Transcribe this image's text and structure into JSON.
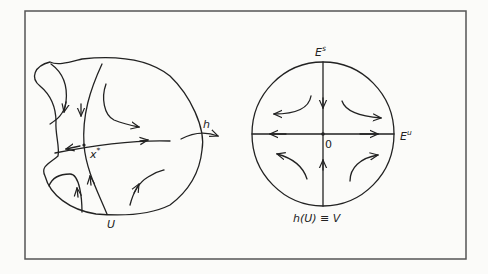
{
  "figure": {
    "frame": {
      "stroke": "#555555",
      "background": "#fbfbf9"
    },
    "left_panel": {
      "region_label": "U",
      "fixed_point_label": "x",
      "fixed_point_sup": "*"
    },
    "map": {
      "label": "h"
    },
    "right_panel": {
      "stable_label": "E",
      "stable_sup": "s",
      "unstable_label": "E",
      "unstable_sup": "u",
      "origin_label": "0",
      "image_label": "h(U) ≡ V"
    }
  }
}
